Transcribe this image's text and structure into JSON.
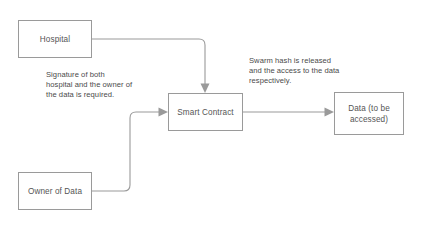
{
  "diagram": {
    "type": "flowchart",
    "canvas": {
      "width": 425,
      "height": 228,
      "background": "#ffffff"
    },
    "colors": {
      "box_border": "#9a9a9a",
      "box_fill": "#ffffff",
      "connector": "#9a9a9a",
      "node_text": "#555555",
      "annotation_text": "#4a4a4a"
    },
    "nodes": [
      {
        "id": "hospital",
        "label": "Hospital",
        "shape": "rectangle",
        "x": 18,
        "y": 20,
        "width": 74,
        "height": 38
      },
      {
        "id": "owner_of_data",
        "label": "Owner of Data",
        "shape": "rectangle",
        "x": 18,
        "y": 172,
        "width": 74,
        "height": 38
      },
      {
        "id": "smart_contract",
        "label": "Smart Contract",
        "shape": "rectangle",
        "x": 168,
        "y": 93,
        "width": 75,
        "height": 38
      },
      {
        "id": "data_accessed",
        "label": "Data (to be\naccessed)",
        "shape": "rectangle",
        "x": 334,
        "y": 92,
        "width": 70,
        "height": 43
      }
    ],
    "annotations": [
      {
        "id": "signature_note",
        "text": "Signature of both\nhospital and the owner of\nthe data is required.",
        "x": 46,
        "y": 70,
        "width": 120,
        "relates_to": "owner_of_data -> smart_contract"
      },
      {
        "id": "swarm_note",
        "text": "Swarm hash is released\nand the access to the data\nrespectively.",
        "x": 249,
        "y": 56,
        "width": 115,
        "relates_to": "smart_contract -> data_accessed"
      }
    ],
    "edges": [
      {
        "id": "hospital-to-smart-contract",
        "from": "hospital",
        "to": "smart_contract",
        "label": "",
        "arrowhead": "down",
        "routing": "orthogonal-rounded"
      },
      {
        "id": "owner-to-smart-contract",
        "from": "owner_of_data",
        "to": "smart_contract",
        "label": "",
        "arrowhead": "right",
        "routing": "orthogonal-rounded"
      },
      {
        "id": "smart-contract-to-data",
        "from": "smart_contract",
        "to": "data_accessed",
        "label": "",
        "arrowhead": "right",
        "routing": "straight"
      }
    ]
  }
}
